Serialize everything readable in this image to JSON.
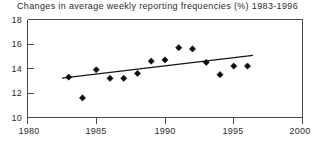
{
  "chart_data": {
    "type": "scatter",
    "title": "Changes in average weekly reporting frequencies (%) 1983-1996",
    "xlabel": "",
    "ylabel": "",
    "xlim": [
      1980,
      2000
    ],
    "ylim": [
      10,
      18
    ],
    "xticks": [
      1980,
      1985,
      1990,
      1995,
      2000
    ],
    "yticks": [
      10,
      12,
      14,
      16,
      18
    ],
    "xtick_labels": [
      "1980",
      "1985",
      "1990",
      "1995",
      "2000"
    ],
    "ytick_labels": [
      "10",
      "12",
      "14",
      "16",
      "18"
    ],
    "grid": false,
    "legend": false,
    "marker": "diamond",
    "marker_color": "#0d0d0d",
    "trendline_color": "#141414",
    "x": [
      1983,
      1984,
      1985,
      1986,
      1987,
      1988,
      1989,
      1990,
      1991,
      1992,
      1993,
      1994,
      1995,
      1996
    ],
    "values": [
      13.3,
      11.6,
      13.9,
      13.2,
      13.2,
      13.6,
      14.6,
      14.7,
      15.7,
      15.6,
      14.5,
      13.5,
      14.2,
      14.2
    ],
    "series": [
      {
        "name": "Average weekly reporting frequency",
        "values": [
          13.3,
          11.6,
          13.9,
          13.2,
          13.2,
          13.6,
          14.6,
          14.7,
          15.7,
          15.6,
          14.5,
          13.5,
          14.2,
          14.2
        ]
      },
      {
        "name": "Linear trend",
        "type": "line",
        "x_endpoints": [
          1982.6,
          1996.5
        ],
        "y_endpoints": [
          13.15,
          15.0
        ]
      }
    ]
  }
}
